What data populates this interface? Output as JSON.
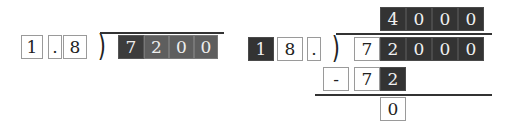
{
  "left_problem": {
    "divisor": [
      "1",
      ".",
      "8"
    ],
    "dividend": [
      "7",
      "2",
      "0",
      "0"
    ],
    "bracket": ")"
  },
  "right_problem": {
    "quotient": [
      "4",
      "0",
      "0",
      "0"
    ],
    "divisor": [
      "1",
      "8",
      "."
    ],
    "dividend": [
      "7",
      "2",
      "0",
      "0",
      "0"
    ],
    "subtraction": [
      "-",
      "7",
      "2"
    ],
    "remainder": [
      "0"
    ],
    "bracket": ")"
  },
  "colors": {
    "dark_box": "#333333",
    "mid_box": "#5e5e5e",
    "border": "#9a9a9a"
  }
}
